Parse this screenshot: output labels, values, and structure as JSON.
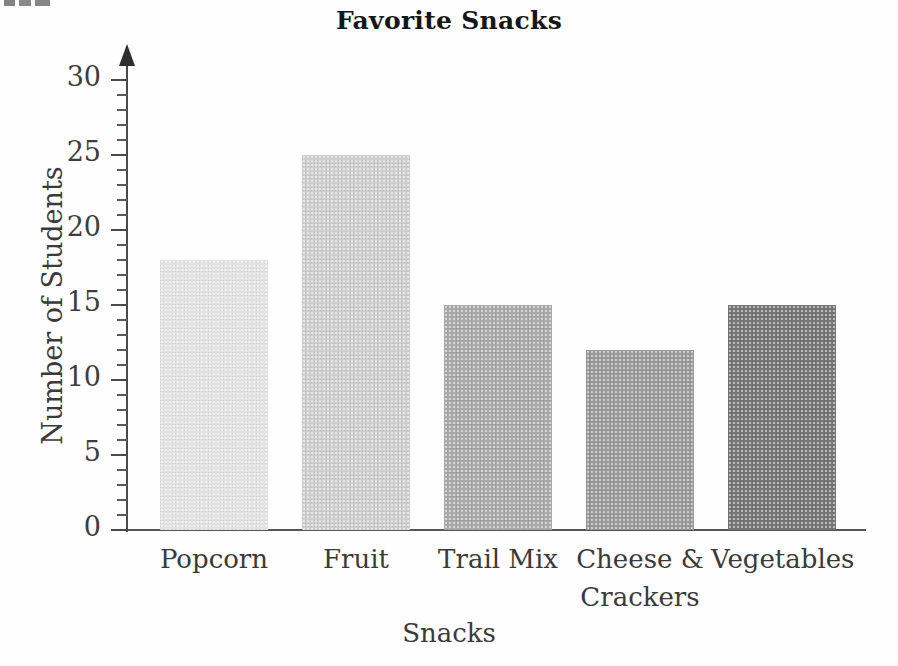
{
  "chart_data": {
    "type": "bar",
    "title": "Favorite Snacks",
    "xlabel": "Snacks",
    "ylabel": "Number of Students",
    "categories": [
      "Popcorn",
      "Fruit",
      "Trail Mix",
      "Cheese &\nCrackers",
      "Vegetables"
    ],
    "values": [
      18,
      25,
      15,
      12,
      15
    ],
    "ylim": [
      0,
      30
    ],
    "ytick_labels": [
      "0",
      "5",
      "10",
      "15",
      "20",
      "25",
      "30"
    ],
    "ytick_values": [
      0,
      5,
      10,
      15,
      20,
      25,
      30
    ],
    "minor_tick_step": 1,
    "grid": false,
    "legend": "none",
    "bar_colors": [
      "#e2e2e2",
      "#cdcdcd",
      "#a9a9a9",
      "#999999",
      "#757575"
    ]
  },
  "axes": {
    "y_axis_name": "y-axis",
    "x_axis_name": "x-axis"
  }
}
